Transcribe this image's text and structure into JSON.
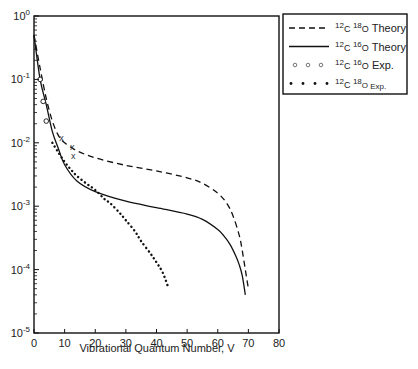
{
  "chart_data": {
    "type": "line",
    "title": "",
    "xlabel": "Vibrational Quantum Number, V",
    "ylabel": "",
    "xlim": [
      0,
      80
    ],
    "ylim": [
      1e-05,
      1
    ],
    "yscale": "log",
    "grid": false,
    "legend_position": "outside-right-top",
    "x_ticks": [
      0,
      10,
      20,
      30,
      40,
      50,
      60,
      70,
      80
    ],
    "y_ticks": [
      {
        "value": 1,
        "base": "10",
        "exp": "0"
      },
      {
        "value": 0.1,
        "base": "10",
        "exp": "-1"
      },
      {
        "value": 0.01,
        "base": "10",
        "exp": "-2"
      },
      {
        "value": 0.001,
        "base": "10",
        "exp": "-3"
      },
      {
        "value": 0.0001,
        "base": "10",
        "exp": "-4"
      },
      {
        "value": 1e-05,
        "base": "10",
        "exp": "-5"
      }
    ],
    "series": [
      {
        "name": "12C 18O Theory",
        "legend": {
          "m1": "12",
          "e1": "C",
          "m2": "18",
          "e2": "O",
          "label": " Theory",
          "small": false
        },
        "style": "dashed",
        "x": [
          0,
          2,
          4,
          6,
          8,
          10,
          14,
          20,
          30,
          40,
          50,
          55,
          60,
          63,
          65,
          67,
          68,
          69,
          70
        ],
        "values": [
          0.5,
          0.15,
          0.05,
          0.022,
          0.013,
          0.01,
          0.0075,
          0.0058,
          0.0044,
          0.0036,
          0.0028,
          0.0023,
          0.0016,
          0.0011,
          0.0007,
          0.00035,
          0.0002,
          0.0001,
          5e-05
        ]
      },
      {
        "name": "12C 16O Theory",
        "legend": {
          "m1": "12",
          "e1": "C",
          "m2": "16",
          "e2": "O",
          "label": " Theory",
          "small": false
        },
        "style": "solid",
        "x": [
          0,
          2,
          4,
          6,
          8,
          10,
          14,
          20,
          30,
          40,
          50,
          55,
          60,
          62,
          64,
          66,
          67,
          68,
          69
        ],
        "values": [
          0.5,
          0.1,
          0.04,
          0.015,
          0.008,
          0.0045,
          0.0025,
          0.0017,
          0.0012,
          0.00095,
          0.00075,
          0.00062,
          0.00043,
          0.00034,
          0.00025,
          0.00016,
          0.00012,
          8e-05,
          4e-05
        ]
      },
      {
        "name": "12C 16O Exp.",
        "legend": {
          "m1": "12",
          "e1": "C",
          "m2": "16",
          "e2": "O",
          "label": " Exp.",
          "small": false
        },
        "style": "open-circles",
        "x": [
          2,
          3,
          4
        ],
        "values": [
          0.1,
          0.045,
          0.022
        ]
      },
      {
        "name": "12C 18O Exp.",
        "legend": {
          "m1": "12",
          "e1": "C",
          "m2": "18",
          "e2": "O",
          "label": " Exp.",
          "small": true
        },
        "style": "dotted",
        "x": [
          6,
          8,
          10,
          12,
          14,
          17,
          20,
          23,
          25,
          28,
          30,
          33,
          35,
          38,
          40,
          42,
          44
        ],
        "values": [
          0.01,
          0.007,
          0.005,
          0.0038,
          0.003,
          0.0023,
          0.0018,
          0.0013,
          0.0011,
          0.00078,
          0.0006,
          0.0004,
          0.00028,
          0.00018,
          0.00013,
          9e-05,
          5e-05
        ]
      }
    ],
    "annotations": [
      {
        "text": "x",
        "x": 9,
        "y": 0.012
      },
      {
        "text": "x",
        "x": 12.5,
        "y": 0.0085
      },
      {
        "text": "x",
        "x": 12.8,
        "y": 0.0062
      }
    ]
  }
}
